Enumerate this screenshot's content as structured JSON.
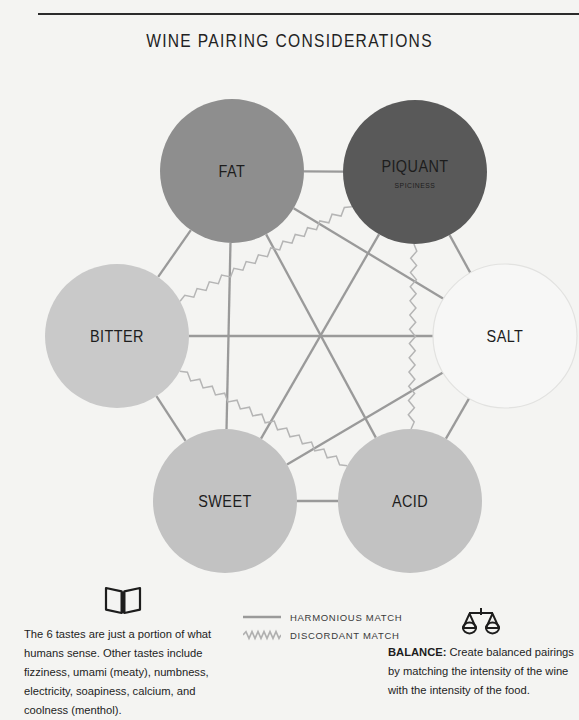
{
  "header": {
    "title": "WINE PAIRING CONSIDERATIONS"
  },
  "diagram": {
    "nodes": [
      {
        "id": "fat",
        "label": "FAT",
        "sublabel": "",
        "cx": 232,
        "cy": 111,
        "r": 72,
        "fill": "#8e8e8e",
        "stroke": "none",
        "label_size": 17,
        "sub_dy": 0
      },
      {
        "id": "piquant",
        "label": "PIQUANT",
        "sublabel": "SPICINESS",
        "cx": 415,
        "cy": 112,
        "r": 72,
        "fill": "#595959",
        "stroke": "none",
        "label_size": 17,
        "sub_dy": 16
      },
      {
        "id": "bitter",
        "label": "BITTER",
        "sublabel": "",
        "cx": 117,
        "cy": 276,
        "r": 72,
        "fill": "#c9c9c9",
        "stroke": "none",
        "label_size": 17,
        "sub_dy": 0
      },
      {
        "id": "salt",
        "label": "SALT",
        "sublabel": "",
        "cx": 505,
        "cy": 276,
        "r": 72,
        "fill": "#f7f7f6",
        "stroke": "#e2e2e0",
        "label_size": 17,
        "sub_dy": 0
      },
      {
        "id": "sweet",
        "label": "SWEET",
        "sublabel": "",
        "cx": 225,
        "cy": 441,
        "r": 72,
        "fill": "#c2c2c2",
        "stroke": "none",
        "label_size": 17,
        "sub_dy": 0
      },
      {
        "id": "acid",
        "label": "ACID",
        "sublabel": "",
        "cx": 410,
        "cy": 441,
        "r": 72,
        "fill": "#c2c2c2",
        "stroke": "none",
        "label_size": 17,
        "sub_dy": 0
      }
    ],
    "links": [
      {
        "from": "fat",
        "to": "piquant",
        "kind": "harmonious"
      },
      {
        "from": "bitter",
        "to": "salt",
        "kind": "harmonious"
      },
      {
        "from": "sweet",
        "to": "acid",
        "kind": "harmonious"
      },
      {
        "from": "fat",
        "to": "sweet",
        "kind": "harmonious"
      },
      {
        "from": "piquant",
        "to": "salt",
        "kind": "harmonious"
      },
      {
        "from": "fat",
        "to": "bitter",
        "kind": "harmonious"
      },
      {
        "from": "bitter",
        "to": "sweet",
        "kind": "harmonious"
      },
      {
        "from": "salt",
        "to": "acid",
        "kind": "harmonious"
      },
      {
        "from": "fat",
        "to": "salt",
        "kind": "harmonious"
      },
      {
        "from": "fat",
        "to": "acid",
        "kind": "harmonious"
      },
      {
        "from": "piquant",
        "to": "sweet",
        "kind": "harmonious"
      },
      {
        "from": "sweet",
        "to": "salt",
        "kind": "harmonious"
      },
      {
        "from": "bitter",
        "to": "piquant",
        "kind": "discordant"
      },
      {
        "from": "bitter",
        "to": "acid",
        "kind": "discordant"
      },
      {
        "from": "piquant",
        "to": "acid",
        "kind": "discordant"
      },
      {
        "from": "fat",
        "to": "sweet2",
        "kind": "none"
      }
    ],
    "link_color": "#9a9a9a",
    "discordant_color": "#b5b5b5"
  },
  "legend": {
    "items": [
      {
        "label": "HARMONIOUS MATCH",
        "style": "solid"
      },
      {
        "label": "DISCORDANT MATCH",
        "style": "zigzag"
      }
    ]
  },
  "notes": {
    "left": {
      "icon": "open-book-icon",
      "text": "The 6 tastes are just a portion of what humans sense. Other tastes include fizziness, umami (meaty), numbness, electricity, soapiness, calcium, and coolness (menthol)."
    },
    "right": {
      "icon": "balance-scales-icon",
      "lead": "BALANCE:",
      "text": " Create balanced pairings by matching the intensity of the wine with the intensity of the food."
    }
  }
}
